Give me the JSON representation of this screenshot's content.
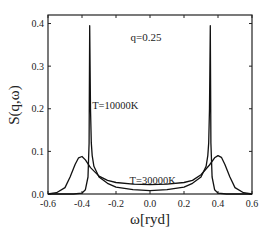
{
  "chart_data": {
    "type": "line",
    "title": "",
    "annotation": "q=0.25",
    "xlabel": "ω[ryd]",
    "ylabel": "S(q,ω)",
    "xlim": [
      -0.6,
      0.6
    ],
    "ylim": [
      0.0,
      0.42
    ],
    "xticks": [
      "-0.6",
      "-0.4",
      "-0.2",
      "0.0",
      "0.2",
      "0.4",
      "0.6"
    ],
    "yticks": [
      "0.0",
      "0.1",
      "0.2",
      "0.3",
      "0.4"
    ],
    "grid": false,
    "legend": "none (inline curve labels)",
    "series": [
      {
        "name": "T=10000K",
        "label_pos": [
          -0.34,
          0.2
        ],
        "x": [
          -0.6,
          -0.45,
          -0.4,
          -0.38,
          -0.365,
          -0.358,
          -0.355,
          -0.35,
          -0.345,
          -0.34,
          -0.33,
          -0.3,
          -0.25,
          -0.2,
          -0.1,
          0.0,
          0.1,
          0.2,
          0.25,
          0.3,
          0.33,
          0.34,
          0.345,
          0.35,
          0.355,
          0.358,
          0.365,
          0.38,
          0.4,
          0.45,
          0.6
        ],
        "values": [
          0.0,
          0.0,
          0.002,
          0.01,
          0.04,
          0.12,
          0.395,
          0.2,
          0.12,
          0.09,
          0.065,
          0.04,
          0.025,
          0.016,
          0.01,
          0.008,
          0.01,
          0.016,
          0.025,
          0.04,
          0.065,
          0.09,
          0.12,
          0.2,
          0.395,
          0.12,
          0.04,
          0.01,
          0.002,
          0.0,
          0.0
        ]
      },
      {
        "name": "T=30000K",
        "label_pos": [
          -0.12,
          0.024
        ],
        "x": [
          -0.6,
          -0.55,
          -0.5,
          -0.47,
          -0.44,
          -0.42,
          -0.4,
          -0.38,
          -0.35,
          -0.3,
          -0.25,
          -0.2,
          -0.1,
          0.0,
          0.1,
          0.2,
          0.25,
          0.3,
          0.35,
          0.38,
          0.4,
          0.42,
          0.44,
          0.47,
          0.5,
          0.55,
          0.6
        ],
        "values": [
          0.0,
          0.003,
          0.015,
          0.04,
          0.07,
          0.085,
          0.088,
          0.08,
          0.062,
          0.042,
          0.032,
          0.027,
          0.023,
          0.022,
          0.023,
          0.027,
          0.032,
          0.045,
          0.068,
          0.085,
          0.09,
          0.086,
          0.07,
          0.04,
          0.015,
          0.003,
          0.0
        ]
      }
    ]
  }
}
